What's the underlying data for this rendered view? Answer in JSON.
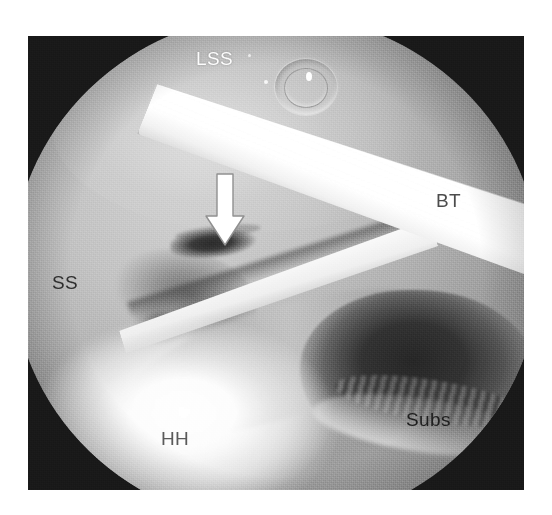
{
  "image": {
    "kind": "arthroscopic-photograph",
    "modality": "shoulder arthroscopy",
    "background_color": "#ffffff",
    "photo_border_color": "#191919",
    "photo_rect": {
      "x": 28,
      "y": 36,
      "width": 496,
      "height": 454
    }
  },
  "scope": {
    "shape": "circular-field-of-view",
    "field_color_light": "#d2d2d2",
    "field_color_dark": "#2f2f2f"
  },
  "labels": [
    {
      "id": "lss",
      "text": "LSS",
      "color": "#fdfdfd",
      "meaning": "superior labrum / long head supraspinatus region",
      "x": 196,
      "y": 48
    },
    {
      "id": "bt",
      "text": "BT",
      "color": "#4c4c4c",
      "meaning": "biceps tendon",
      "x": 436,
      "y": 190
    },
    {
      "id": "ss",
      "text": "SS",
      "color": "#2e2e2e",
      "meaning": "supraspinatus",
      "x": 52,
      "y": 272
    },
    {
      "id": "hh",
      "text": "HH",
      "color": "#5a5a5a",
      "meaning": "humeral head",
      "x": 161,
      "y": 428
    },
    {
      "id": "subs",
      "text": "Subs",
      "color": "#1f1f1f",
      "meaning": "subscapularis",
      "x": 406,
      "y": 409
    }
  ],
  "annotations": [
    {
      "id": "arrow",
      "kind": "arrow",
      "direction": "down",
      "color": "#ffffff",
      "outline_color": "#8c8c8c",
      "x": 176,
      "y": 136,
      "width": 42,
      "height": 76,
      "points_at": "lesion"
    }
  ],
  "features": [
    {
      "id": "lesion",
      "kind": "dark-lesion-ellipse",
      "color": "#2c2c2c",
      "x": 158,
      "y": 214,
      "width": 92,
      "height": 30
    },
    {
      "id": "bt-band",
      "kind": "bright-tendon-band",
      "color": "#ffffff",
      "angle_deg": 22
    },
    {
      "id": "bt-band2",
      "kind": "bright-tendon-band",
      "color": "#fbfbfb",
      "angle_deg": -17
    },
    {
      "id": "subs-recess",
      "kind": "dark-recess",
      "color": "#272727",
      "x": 288,
      "y": 276,
      "width": 236,
      "height": 170
    },
    {
      "id": "hh-bloom",
      "kind": "specular-bright-area",
      "color": "#ffffff",
      "x": 28,
      "y": 300,
      "width": 300,
      "height": 190
    },
    {
      "id": "bubbles",
      "kind": "fluid-bubble-cluster",
      "color": "#ffffff",
      "x": 262,
      "y": 44,
      "width": 62,
      "height": 56
    }
  ]
}
